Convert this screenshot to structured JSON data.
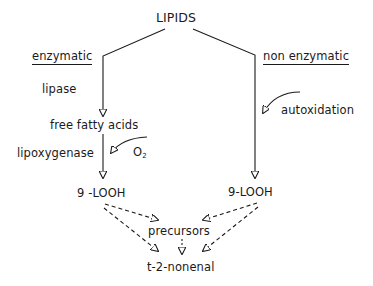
{
  "diagram": {
    "title": "LIPIDS",
    "branches": {
      "left": {
        "heading": "enzymatic",
        "step1_enzyme": "lipase",
        "intermediate": "free fatty acids",
        "step2_enzyme": "lipoxygenase",
        "cofactor": "O",
        "cofactor_subscript": "2",
        "product": "9 -LOOH"
      },
      "right": {
        "heading": "non enzymatic",
        "process": "autoxidation",
        "product": "9-LOOH"
      }
    },
    "convergence": {
      "precursors": "precursors",
      "final_product": "t-2-nonenal"
    },
    "colors": {
      "ink": "#1a1a1a",
      "background": "#ffffff"
    }
  }
}
